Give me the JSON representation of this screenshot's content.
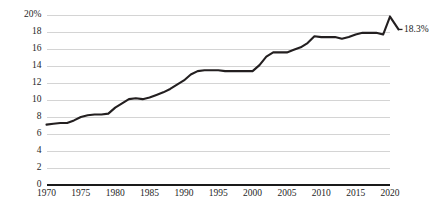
{
  "chart_data": {
    "type": "line",
    "title": "",
    "subtitle": "",
    "xlabel": "",
    "ylabel": "",
    "xlim": [
      1970,
      2020
    ],
    "ylim": [
      0,
      20
    ],
    "grid": true,
    "legend": null,
    "legend_position": "none",
    "y_ticks": [
      0,
      2,
      4,
      6,
      8,
      10,
      12,
      14,
      16,
      18,
      20
    ],
    "y_tick_labels": [
      "0",
      "2",
      "4",
      "6",
      "8",
      "10",
      "12",
      "14",
      "16",
      "18",
      "20%"
    ],
    "x_ticks": [
      1970,
      1975,
      1980,
      1985,
      1990,
      1995,
      2000,
      2005,
      2010,
      2015,
      2020
    ],
    "x_tick_labels": [
      "1970",
      "1975",
      "1980",
      "1985",
      "1990",
      "1995",
      "2000",
      "2005",
      "2010",
      "2015",
      "2020"
    ],
    "series": [
      {
        "name": "Share of GDP",
        "color": "#231f20",
        "x": [
          1970,
          1971,
          1972,
          1973,
          1974,
          1975,
          1976,
          1977,
          1978,
          1979,
          1980,
          1981,
          1982,
          1983,
          1984,
          1985,
          1986,
          1987,
          1988,
          1989,
          1990,
          1991,
          1992,
          1993,
          1994,
          1995,
          1996,
          1997,
          1998,
          1999,
          2000,
          2001,
          2002,
          2003,
          2004,
          2005,
          2006,
          2007,
          2008,
          2009,
          2010,
          2011,
          2012,
          2013,
          2014,
          2015,
          2016,
          2017,
          2018,
          2019,
          2020
        ],
        "values": [
          7.1,
          7.2,
          7.3,
          7.3,
          7.6,
          8.0,
          8.2,
          8.3,
          8.3,
          8.4,
          9.1,
          9.6,
          10.1,
          10.2,
          10.1,
          10.3,
          10.6,
          10.9,
          11.3,
          11.8,
          12.3,
          13.0,
          13.4,
          13.5,
          13.5,
          13.5,
          13.4,
          13.4,
          13.4,
          13.4,
          13.4,
          14.1,
          15.1,
          15.6,
          15.6,
          15.6,
          15.9,
          16.2,
          16.7,
          17.5,
          17.4,
          17.4,
          17.4,
          17.2,
          17.4,
          17.7,
          17.9,
          17.9,
          17.9,
          17.7,
          19.8
        ],
        "end_annotation": "18.3%",
        "end_annotation_value": 18.3
      }
    ],
    "annotations": [
      {
        "text": "18.3%",
        "x": 2020,
        "y": 18.3
      }
    ]
  }
}
